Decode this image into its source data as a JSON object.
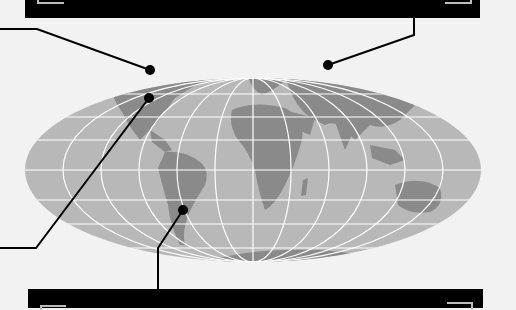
{
  "figure": {
    "type": "world map callout diagram",
    "projection": "elliptical (Mollweide-like) with graticule",
    "colors": {
      "background": "#f2f2f2",
      "ocean": "#b8b8b8",
      "land": "#8a8a8a",
      "graticule": "#ffffff",
      "banner": "#000000",
      "leader": "#000000",
      "corner_marks": "#bdbdbd"
    }
  },
  "banners": {
    "top": {
      "text": ""
    },
    "bottom": {
      "text": ""
    }
  },
  "markers": [
    {
      "id": "north-america-north",
      "label": "",
      "x": 150,
      "y": 70
    },
    {
      "id": "north-america-east",
      "label": "",
      "x": 149,
      "y": 98
    },
    {
      "id": "russia",
      "label": "",
      "x": 328,
      "y": 65
    },
    {
      "id": "south-america-south",
      "label": "",
      "x": 183,
      "y": 210
    }
  ]
}
